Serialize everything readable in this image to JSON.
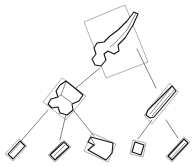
{
  "figure": {
    "type": "hierarchy-tree",
    "title": "",
    "background_color": "#ffffff",
    "edge_color": "#4a4a4a",
    "bbox_color": "#8e8e8e",
    "fragment_outline_color": "#111111",
    "fragment_fill_color": "#ffffff",
    "width": 195,
    "height": 167
  },
  "tree": {
    "root_id": "n0",
    "levels": 3,
    "node_count": 9,
    "edge_count": 8,
    "edges": [
      {
        "from": "n0",
        "to": "n1"
      },
      {
        "from": "n0",
        "to": "n2"
      },
      {
        "from": "n1",
        "to": "n3"
      },
      {
        "from": "n1",
        "to": "n4"
      },
      {
        "from": "n1",
        "to": "n5"
      },
      {
        "from": "n2",
        "to": "n6"
      },
      {
        "from": "n2",
        "to": "n7"
      }
    ]
  },
  "nodes": [
    {
      "id": "n0",
      "label": "root-fragment",
      "level": 0,
      "center": [
        123,
        40
      ],
      "rotation_deg": -32,
      "box_w": 46,
      "box_h": 76
    },
    {
      "id": "n1",
      "label": "child-fragment-left",
      "level": 1,
      "center": [
        62,
        100
      ],
      "rotation_deg": -28,
      "box_w": 40,
      "box_h": 40
    },
    {
      "id": "n2",
      "label": "child-fragment-right",
      "level": 1,
      "center": [
        161,
        104
      ],
      "rotation_deg": 28,
      "box_w": 17,
      "box_h": 44
    },
    {
      "id": "n3",
      "label": "leaf-fragment-sliver-a",
      "level": 2,
      "center": [
        16,
        150
      ],
      "rotation_deg": -27,
      "box_w": 10,
      "box_h": 22
    },
    {
      "id": "n4",
      "label": "leaf-fragment-sliver-b",
      "level": 2,
      "center": [
        58,
        151
      ],
      "rotation_deg": -22,
      "box_w": 11,
      "box_h": 20
    },
    {
      "id": "n5",
      "label": "leaf-fragment-wedge",
      "level": 2,
      "center": [
        96,
        148
      ],
      "rotation_deg": -20,
      "box_w": 30,
      "box_h": 19
    },
    {
      "id": "n6",
      "label": "leaf-fragment-quad",
      "level": 2,
      "center": [
        137,
        148
      ],
      "rotation_deg": 14,
      "box_w": 15,
      "box_h": 15
    },
    {
      "id": "n7",
      "label": "leaf-fragment-sliver-c",
      "level": 2,
      "center": [
        177,
        149
      ],
      "rotation_deg": 22,
      "box_w": 11,
      "box_h": 26
    }
  ]
}
